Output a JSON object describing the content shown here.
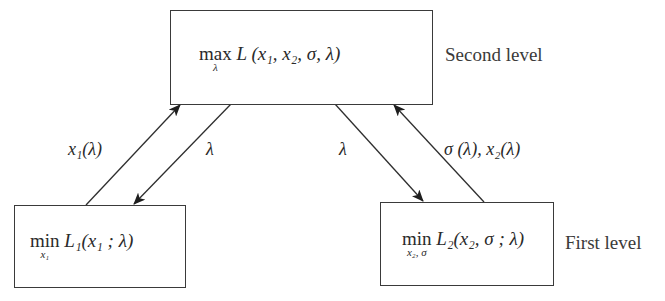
{
  "diagram": {
    "type": "bilevel-optimization-flow",
    "nodes": {
      "top": {
        "operator": "max",
        "operator_subscript": "λ",
        "formula": "L (x₁, x₂, σ, λ)",
        "level_label": "Second level"
      },
      "bottom_left": {
        "operator": "min",
        "operator_subscript": "x₁",
        "formula": "L₁(x₁ ; λ)"
      },
      "bottom_right": {
        "operator": "min",
        "operator_subscript": "x₂, σ",
        "formula": "L₂(x₂, σ ; λ)",
        "level_label": "First level"
      }
    },
    "edges": [
      {
        "from": "bottom_left",
        "to": "top",
        "label": "x₁(λ)"
      },
      {
        "from": "top",
        "to": "bottom_left",
        "label": "λ"
      },
      {
        "from": "top",
        "to": "bottom_right",
        "label": "λ"
      },
      {
        "from": "bottom_right",
        "to": "top",
        "label": "σ (λ), x₂(λ)"
      }
    ]
  }
}
